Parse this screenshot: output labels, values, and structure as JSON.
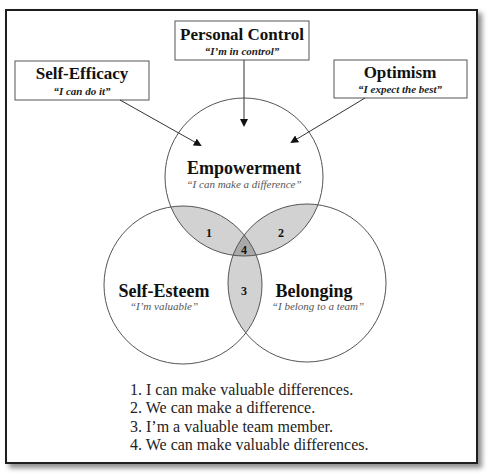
{
  "factors": [
    {
      "title": "Self-Efficacy",
      "subtitle": "“I can do it”"
    },
    {
      "title": "Personal Control",
      "subtitle": "“I’m in control”"
    },
    {
      "title": "Optimism",
      "subtitle": "“I expect the best”"
    }
  ],
  "circles": [
    {
      "title": "Empowerment",
      "subtitle": "“I can make a difference”"
    },
    {
      "title": "Self-Esteem",
      "subtitle": "“I’m valuable”"
    },
    {
      "title": "Belonging",
      "subtitle": "“I belong to a team”"
    }
  ],
  "regions": [
    {
      "number": "1"
    },
    {
      "number": "2"
    },
    {
      "number": "3"
    },
    {
      "number": "4"
    }
  ],
  "legend": [
    "1. I can make valuable differences.",
    "2. We can make a difference.",
    "3. I’m a valuable team member.",
    "4. We can make valuable differences."
  ],
  "colors": {
    "pair_overlap": "#d2d2d2",
    "triple_overlap": "#a9a9a9",
    "outline": "#555555"
  }
}
